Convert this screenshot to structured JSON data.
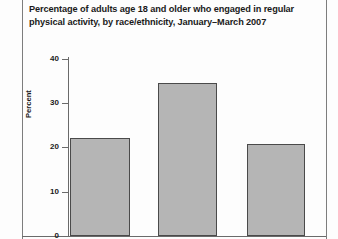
{
  "title": {
    "line1": "Percentage of adults age 18 and older who engaged in regular",
    "line2": "physical activity, by race/ethnicity, January–March 2007"
  },
  "axis": {
    "ylabel": "Percent",
    "ticks": [
      "0",
      "10",
      "20",
      "30",
      "40"
    ]
  },
  "colors": {
    "bar_fill": "#b5b5b5",
    "bar_border": "#4a4a4a",
    "axis": "#6a6a6a",
    "rule": "#7d7d7d",
    "text": "#1a1a1a",
    "background": "#fdfdfd"
  },
  "chart_data": {
    "type": "bar",
    "title": "Percentage of adults age 18 and older who engaged in regular physical activity, by race/ethnicity, January–March 2007",
    "xlabel": "",
    "ylabel": "Percent",
    "ylim": [
      0,
      40
    ],
    "yticks": [
      0,
      10,
      20,
      30,
      40
    ],
    "grid": false,
    "legend": "none",
    "categories": [
      "Bar 1",
      "Bar 2",
      "Bar 3"
    ],
    "values": [
      22.2,
      34.5,
      20.7
    ],
    "note": "Category axis labels are cropped out of the visible image"
  }
}
